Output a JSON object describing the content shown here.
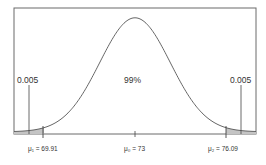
{
  "chart_data": {
    "type": "area",
    "title": "",
    "xlabel": "",
    "ylabel": "",
    "distribution": {
      "mean": 73,
      "lower_critical": 69.91,
      "upper_critical": 76.09
    },
    "regions": [
      {
        "name": "lower tail",
        "from": "-inf",
        "to": 69.91,
        "probability": 0.005,
        "shaded": true
      },
      {
        "name": "center",
        "from": 69.91,
        "to": 76.09,
        "probability": 0.99,
        "shaded": false
      },
      {
        "name": "upper tail",
        "from": 76.09,
        "to": "inf",
        "probability": 0.005,
        "shaded": true
      }
    ],
    "annotations": {
      "left_tail": "0.005",
      "center": "99%",
      "right_tail": "0.005"
    },
    "tick_labels": [
      {
        "symbol": "μ₁",
        "value": "69.91",
        "text": "μ₁ = 69.91"
      },
      {
        "symbol": "μ₀",
        "value": "73",
        "text": "μ₀ = 73"
      },
      {
        "symbol": "μ₂",
        "value": "76.09",
        "text": "μ₂ = 76.09"
      }
    ],
    "grid": false,
    "legend": null
  },
  "colors": {
    "frame": "#666666",
    "curve": "#555555",
    "shade": "#bdbdbd",
    "text": "#333333"
  }
}
